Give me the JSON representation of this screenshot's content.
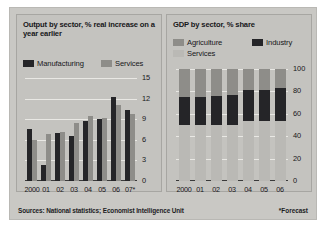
{
  "figure": {
    "source_note": "Sources: National statistics; Economist Intelligence Unit",
    "forecast_note": "*Forecast"
  },
  "left_panel": {
    "title": "Output by sector, % real increase on a year earlier",
    "legend": [
      {
        "label": "Manufacturing",
        "color": "#252528"
      },
      {
        "label": "Services",
        "color": "#8e8d89"
      }
    ]
  },
  "right_panel": {
    "title": "GDP by sector, % share",
    "legend": [
      {
        "label": "Agriculture",
        "color": "#8e8d89"
      },
      {
        "label": "Industry",
        "color": "#252528"
      },
      {
        "label": "Services",
        "color": "#bab9b5"
      }
    ]
  },
  "chart_data": [
    {
      "id": "output-by-sector",
      "type": "bar",
      "title": "Output by sector, % real increase on a year earlier",
      "xlabel": "",
      "ylabel": "% real increase on a year earlier",
      "categories": [
        "2000",
        "01",
        "02",
        "03",
        "04",
        "05",
        "06",
        "07*"
      ],
      "series": [
        {
          "name": "Manufacturing",
          "color": "#252528",
          "values": [
            7.6,
            2.4,
            7.0,
            6.6,
            8.7,
            9.0,
            12.3,
            10.4
          ]
        },
        {
          "name": "Services",
          "color": "#8e8d89",
          "values": [
            6.0,
            6.9,
            7.2,
            8.5,
            9.5,
            9.2,
            11.1,
            9.7
          ]
        }
      ],
      "ylim": [
        0,
        15
      ],
      "yticks": [
        0,
        3,
        6,
        9,
        12,
        15
      ],
      "grid": true,
      "legend_position": "top",
      "notes": "07* is a forecast"
    },
    {
      "id": "gdp-by-sector",
      "type": "bar",
      "stacked": true,
      "title": "GDP by sector, % share",
      "xlabel": "",
      "ylabel": "% share",
      "categories": [
        "2000",
        "01",
        "02",
        "03",
        "04",
        "05",
        "06"
      ],
      "series": [
        {
          "name": "Services",
          "color": "#bab9b5",
          "values": [
            50,
            50,
            50,
            50,
            54,
            54,
            54
          ]
        },
        {
          "name": "Industry",
          "color": "#252528",
          "values": [
            25,
            25,
            26,
            27,
            27,
            27,
            29
          ]
        },
        {
          "name": "Agriculture",
          "color": "#8e8d89",
          "values": [
            25,
            25,
            24,
            23,
            19,
            19,
            17
          ]
        }
      ],
      "ylim": [
        0,
        100
      ],
      "yticks": [
        0,
        20,
        40,
        60,
        80,
        100
      ],
      "grid": true,
      "legend_position": "top"
    }
  ]
}
